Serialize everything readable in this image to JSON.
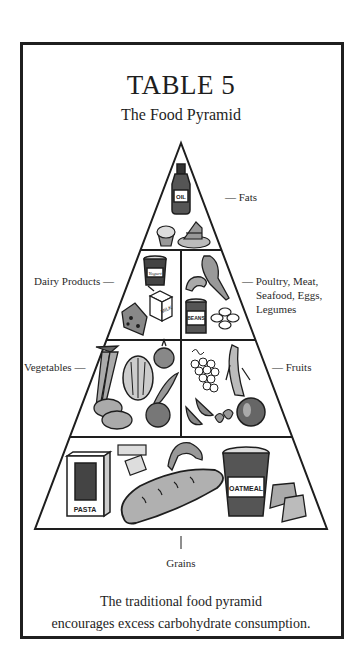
{
  "header": {
    "title": "TABLE 5",
    "subtitle": "The Food Pyramid"
  },
  "pyramid": {
    "tiers": [
      {
        "name": "fats",
        "label": "— Fats",
        "items": [
          "oil-bottle",
          "muffin",
          "cake-slice"
        ],
        "item_text": [
          "OIL"
        ]
      },
      {
        "name": "dairy",
        "label": "Dairy Products —",
        "items": [
          "yogurt",
          "milk-carton",
          "cheese"
        ],
        "item_text": [
          "Yogurt",
          "MILK"
        ]
      },
      {
        "name": "protein",
        "label_lines": [
          "— Poultry, Meat,",
          "Seafood, Eggs,",
          "Legumes"
        ],
        "items": [
          "chicken-leg",
          "shrimp",
          "beans-can",
          "eggs"
        ],
        "item_text": [
          "BEANS"
        ]
      },
      {
        "name": "vegetables",
        "label": "Vegetables —",
        "items": [
          "carrots",
          "lettuce",
          "onion",
          "pea-pod",
          "potatoes",
          "tomato"
        ]
      },
      {
        "name": "fruits",
        "label": "— Fruits",
        "items": [
          "grapes",
          "banana",
          "watermelon",
          "strawberries",
          "apple"
        ]
      },
      {
        "name": "grains",
        "label": "Grains",
        "items": [
          "pasta-box",
          "crackers",
          "croissant",
          "bread-loaf",
          "oatmeal-tub",
          "toast"
        ],
        "item_text": [
          "PASTA",
          "OATMEAL"
        ]
      }
    ]
  },
  "caption": {
    "line1": "The traditional food pyramid",
    "line2": "encourages excess carbohydrate consumption."
  },
  "colors": {
    "ink": "#1e1e1e",
    "fill_gray": "#a8a8a8",
    "light_gray": "#d0d0d0",
    "background": "#ffffff"
  }
}
